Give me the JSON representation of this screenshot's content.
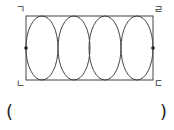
{
  "diagram": {
    "rect": {
      "x": 26,
      "y": 16,
      "width": 127,
      "height": 64
    },
    "circles": [
      {
        "cx": 45,
        "cy": 48,
        "rx": 19,
        "ry": 32
      },
      {
        "cx": 76,
        "cy": 48,
        "rx": 19,
        "ry": 32
      },
      {
        "cx": 106,
        "cy": 48,
        "rx": 19,
        "ry": 32
      },
      {
        "cx": 135,
        "cy": 48,
        "rx": 19,
        "ry": 32
      }
    ],
    "points": [
      {
        "x": 26,
        "y": 48
      },
      {
        "x": 153,
        "y": 48
      }
    ],
    "stroke_color": "#444444"
  },
  "labels": {
    "top_left": "ㄱ",
    "top_right": "ㄹ",
    "bottom_left": "ㄴ",
    "bottom_right": "ㄷ"
  },
  "answer": {
    "open_paren": "(",
    "close_paren": ")",
    "value": ""
  }
}
